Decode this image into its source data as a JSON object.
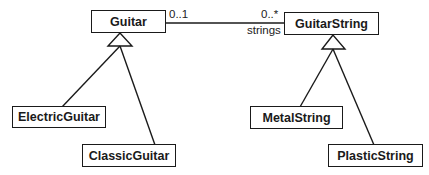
{
  "diagram": {
    "type": "uml-class-diagram",
    "classes": [
      {
        "id": "guitar",
        "name": "Guitar"
      },
      {
        "id": "guitar_string",
        "name": "GuitarString"
      },
      {
        "id": "electric_guitar",
        "name": "ElectricGuitar"
      },
      {
        "id": "classic_guitar",
        "name": "ClassicGuitar"
      },
      {
        "id": "metal_string",
        "name": "MetalString"
      },
      {
        "id": "plastic_string",
        "name": "PlasticString"
      }
    ],
    "association": {
      "from": "Guitar",
      "to": "GuitarString",
      "from_multiplicity": "0..1",
      "to_multiplicity": "0..*",
      "role": "strings"
    },
    "generalizations": [
      {
        "child": "ElectricGuitar",
        "parent": "Guitar"
      },
      {
        "child": "ClassicGuitar",
        "parent": "Guitar"
      },
      {
        "child": "MetalString",
        "parent": "GuitarString"
      },
      {
        "child": "PlasticString",
        "parent": "GuitarString"
      }
    ],
    "colors": {
      "line": "#1a1a1a",
      "background": "#ffffff"
    }
  }
}
